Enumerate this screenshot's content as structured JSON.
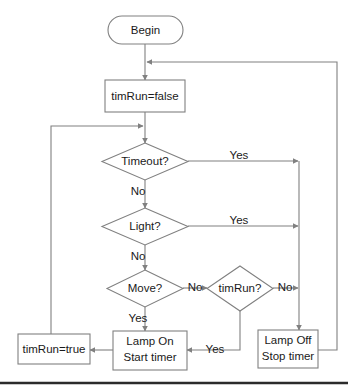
{
  "diagram": {
    "colors": {
      "stroke": "#808080",
      "text": "#1a1a1a",
      "fill": "#ffffff",
      "rule": "#2b2b2b"
    },
    "nodes": {
      "begin": {
        "label": "Begin",
        "shape": "terminator"
      },
      "tim_run_false": {
        "label": "timRun=false",
        "shape": "process"
      },
      "timeout": {
        "label": "Timeout?",
        "shape": "decision"
      },
      "light": {
        "label": "Light?",
        "shape": "decision"
      },
      "move": {
        "label": "Move?",
        "shape": "decision"
      },
      "tim_run_q": {
        "label": "timRun?",
        "shape": "decision"
      },
      "tim_run_true": {
        "label": "timRun=true",
        "shape": "process"
      },
      "lamp_on": {
        "label_line1": "Lamp On",
        "label_line2": "Start timer",
        "shape": "process"
      },
      "lamp_off": {
        "label_line1": "Lamp Off",
        "label_line2": "Stop timer",
        "shape": "process"
      }
    },
    "edge_labels": {
      "timeout_yes": "Yes",
      "timeout_no": "No",
      "light_yes": "Yes",
      "light_no": "No",
      "move_no": "No",
      "move_yes": "Yes",
      "timrun_no": "No",
      "timrun_yes": "Yes"
    }
  }
}
